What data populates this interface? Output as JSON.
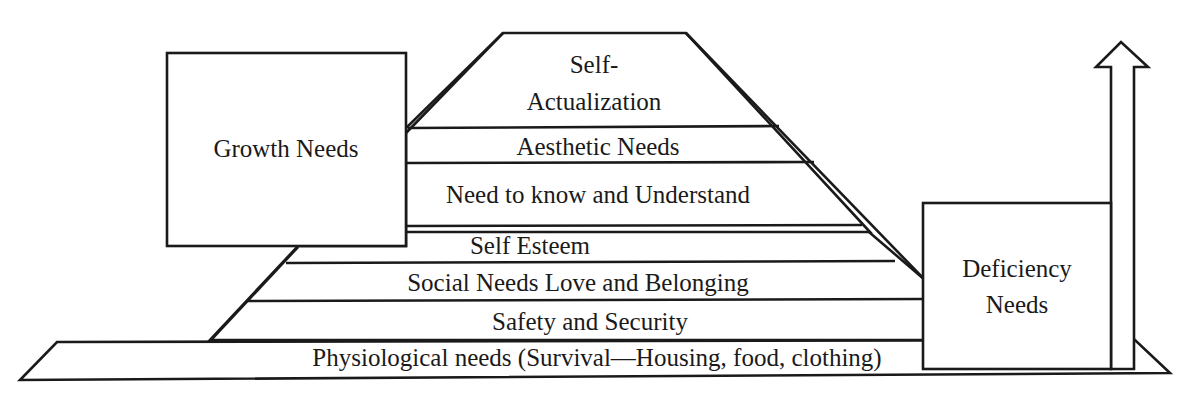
{
  "diagram": {
    "levels": [
      {
        "id": "self-actualization",
        "line1": "Self-",
        "line2": "Actualization"
      },
      {
        "id": "aesthetic",
        "label": "Aesthetic Needs"
      },
      {
        "id": "know-understand",
        "label": "Need to know and Understand"
      },
      {
        "id": "self-esteem",
        "label": "Self Esteem"
      },
      {
        "id": "social",
        "label": "Social Needs Love and Belonging"
      },
      {
        "id": "safety",
        "label": "Safety and Security"
      },
      {
        "id": "physiological",
        "label": "Physiological needs (Survival—Housing, food, clothing)"
      }
    ],
    "groups": {
      "growth": {
        "label": "Growth Needs"
      },
      "deficiency": {
        "line1": "Deficiency",
        "line2": "Needs"
      }
    },
    "arrow": {
      "direction": "up",
      "icon": "arrow-up-icon"
    },
    "colors": {
      "stroke": "#1a1a1a",
      "fill": "#ffffff"
    }
  }
}
